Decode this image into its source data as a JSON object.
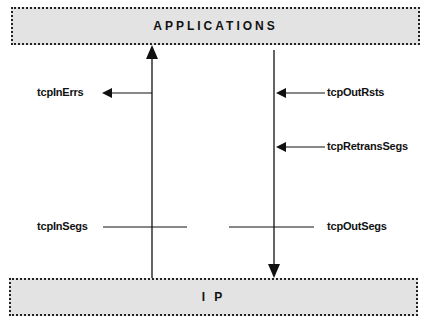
{
  "layers": {
    "top": "APPLICATIONS",
    "bottom": "I P"
  },
  "counters": {
    "in_errors": "tcpInErrs",
    "out_resets": "tcpOutRsts",
    "retrans_segs": "tcpRetransSegs",
    "in_segs": "tcpInSegs",
    "out_segs": "tcpOutSegs"
  },
  "flows": {
    "inbound": "IP to APPLICATIONS (upward arrow)",
    "outbound": "APPLICATIONS to IP (downward arrow)"
  }
}
